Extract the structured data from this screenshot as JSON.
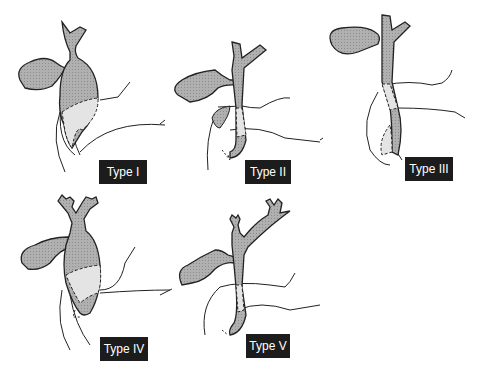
{
  "colors": {
    "duct_fill": "#a8a8a8",
    "cyst_light_fill": "#e2e2e2",
    "outline": "#222222",
    "label_bg": "#1c1c1c",
    "label_text": "#ffffff"
  },
  "panels": [
    {
      "id": "type-1",
      "label": "Type I"
    },
    {
      "id": "type-2",
      "label": "Type II"
    },
    {
      "id": "type-3",
      "label": "Type III"
    },
    {
      "id": "type-4",
      "label": "Type IV"
    },
    {
      "id": "type-5",
      "label": "Type V"
    }
  ]
}
